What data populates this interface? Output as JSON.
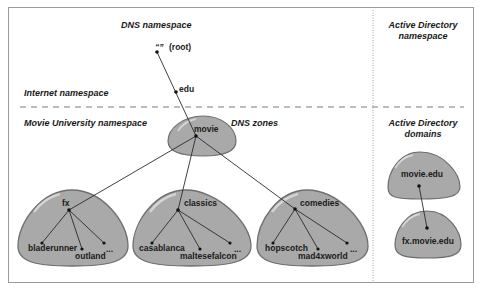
{
  "headings": {
    "dns_namespace": "DNS namespace",
    "ad_namespace_line1": "Active Directory",
    "ad_namespace_line2": "namespace",
    "internet_namespace": "Internet namespace",
    "movie_university_namespace": "Movie University namespace",
    "dns_zones": "DNS zones",
    "ad_domains_line1": "Active Directory",
    "ad_domains_line2": "domains"
  },
  "dns_tree": {
    "root": {
      "quote": "“”",
      "label": "(root)"
    },
    "edu": "edu",
    "movie": "movie",
    "zones": [
      {
        "name": "fx",
        "children": [
          "bladerunner",
          "outland",
          "..."
        ]
      },
      {
        "name": "classics",
        "children": [
          "casablanca",
          "maltesefalcon",
          "..."
        ]
      },
      {
        "name": "comedies",
        "children": [
          "hopscotch",
          "mad4xworld",
          "..."
        ]
      }
    ]
  },
  "ad_domains": [
    {
      "name": "movie.edu"
    },
    {
      "name": "fx.movie.edu"
    }
  ],
  "colors": {
    "blob_fill": "#a9a9a9",
    "blob_stroke": "#6e6e6e",
    "line": "#2a2a2a",
    "divider": "#8a8a8a",
    "border": "#9a9a9a"
  }
}
